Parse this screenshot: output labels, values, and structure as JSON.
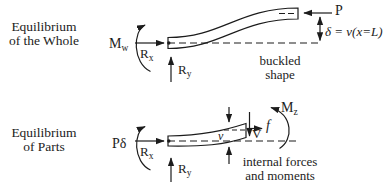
{
  "figure": {
    "description_colors": {
      "ink": "#1c1c1c",
      "background": "#ffffff"
    }
  },
  "headings": {
    "whole_line1": "Equilibrium",
    "whole_line2": "of the Whole",
    "parts_line1": "Equilibrium",
    "parts_line2": "of Parts"
  },
  "top_diagram": {
    "moment_label": {
      "main": "M",
      "sub": "w"
    },
    "reaction_x": {
      "main": "R",
      "sub": "x"
    },
    "reaction_y": {
      "main": "R",
      "sub": "y"
    },
    "load_label": "P",
    "deflection_label": "δ = v(x=L)",
    "caption_line1": "buckled",
    "caption_line2": "shape"
  },
  "bottom_diagram": {
    "moment_label": "Pδ",
    "reaction_x": {
      "main": "R",
      "sub": "x"
    },
    "reaction_y": {
      "main": "R",
      "sub": "y"
    },
    "deflection_label": "v",
    "shear_label": "V",
    "axial_label": "f",
    "internal_moment_label": {
      "main": "M",
      "sub": "z"
    },
    "caption_line1": "internal forces",
    "caption_line2": "and moments"
  }
}
